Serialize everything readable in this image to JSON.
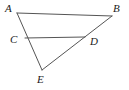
{
  "figure": {
    "kind": "geometry-diagram",
    "background_color": "#ffffff",
    "stroke_color": "#555555",
    "label_color": "#1a1a1a",
    "stroke_width": 1,
    "points": [
      {
        "name": "A",
        "label": "A",
        "x": 17,
        "y": 13,
        "label_x": 5,
        "label_y": 3
      },
      {
        "name": "B",
        "label": "B",
        "x": 112,
        "y": 16,
        "label_x": 113,
        "label_y": 3
      },
      {
        "name": "C",
        "label": "C",
        "x": 25,
        "y": 38,
        "label_x": 10,
        "label_y": 34
      },
      {
        "name": "D",
        "label": "D",
        "x": 85,
        "y": 37,
        "label_x": 90,
        "label_y": 36
      },
      {
        "name": "E",
        "label": "E",
        "x": 42,
        "y": 70,
        "label_x": 37,
        "label_y": 74
      }
    ],
    "segments": [
      {
        "name": "segment-AB",
        "from": "A",
        "to": "B",
        "x1": 17,
        "y1": 13,
        "x2": 112,
        "y2": 16
      },
      {
        "name": "segment-AE",
        "from": "A",
        "to": "E",
        "x1": 17,
        "y1": 13,
        "x2": 42,
        "y2": 70
      },
      {
        "name": "segment-BE",
        "from": "B",
        "to": "E",
        "x1": 112,
        "y1": 16,
        "x2": 42,
        "y2": 70
      },
      {
        "name": "segment-CD",
        "from": "C",
        "to": "D",
        "x1": 25,
        "y1": 38,
        "x2": 85,
        "y2": 37
      }
    ]
  }
}
